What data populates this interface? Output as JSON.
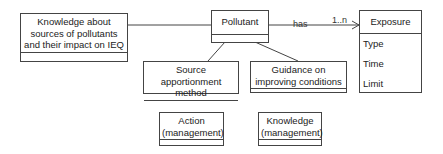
{
  "classes": {
    "knowledge_sources": {
      "name": "Knowledge about sources of pollutants and their impact on IEQ",
      "lines": [
        "Knowledge about",
        "sources of pollutants",
        "and their impact on IEQ"
      ]
    },
    "pollutant": {
      "name": "Pollutant"
    },
    "exposure": {
      "name": "Exposure",
      "attributes": [
        "Type",
        "Time",
        "Limit"
      ]
    },
    "source_apportionment": {
      "lines": [
        "Source apportionment",
        "method"
      ]
    },
    "guidance": {
      "lines": [
        "Guidance on",
        "improving conditions"
      ]
    },
    "action": {
      "lines": [
        "Action",
        "(management)"
      ]
    },
    "knowledge_mgmt": {
      "lines": [
        "Knowledge",
        "(management)"
      ]
    }
  },
  "associations": {
    "has": {
      "label": "has",
      "multiplicity": "1..n"
    }
  }
}
